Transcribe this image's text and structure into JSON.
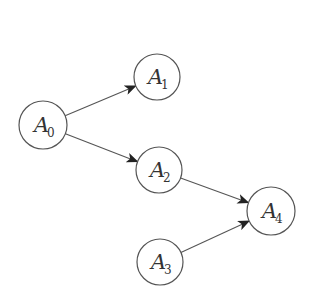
{
  "diagram": {
    "type": "directed-graph",
    "colors": {
      "stroke": "#555555",
      "text": "#333333",
      "background": "#ffffff"
    },
    "nodes": [
      {
        "id": "A0",
        "letter": "A",
        "sub": "0",
        "cx": 43,
        "cy": 125,
        "r": 24
      },
      {
        "id": "A1",
        "letter": "A",
        "sub": "1",
        "cx": 157,
        "cy": 77,
        "r": 23
      },
      {
        "id": "A2",
        "letter": "A",
        "sub": "2",
        "cx": 159,
        "cy": 170,
        "r": 23
      },
      {
        "id": "A3",
        "letter": "A",
        "sub": "3",
        "cx": 160,
        "cy": 262,
        "r": 23
      },
      {
        "id": "A4",
        "letter": "A",
        "sub": "4",
        "cx": 271,
        "cy": 211,
        "r": 24
      }
    ],
    "edges": [
      {
        "from": "A0",
        "to": "A1"
      },
      {
        "from": "A0",
        "to": "A2"
      },
      {
        "from": "A2",
        "to": "A4"
      },
      {
        "from": "A3",
        "to": "A4"
      }
    ]
  }
}
